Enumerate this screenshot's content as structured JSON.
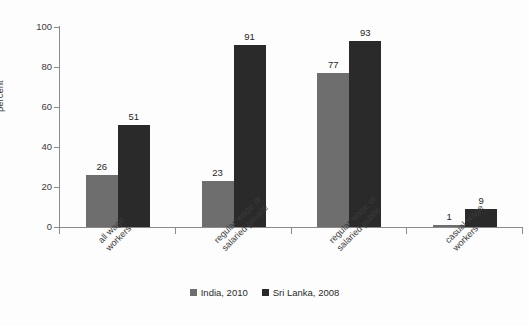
{
  "chart_data": {
    "type": "bar",
    "title": "",
    "subtitle": "",
    "xlabel": "",
    "ylabel": "percent",
    "ylim": [
      0,
      100
    ],
    "yticks": [
      0,
      20,
      40,
      60,
      80,
      100
    ],
    "grid": false,
    "legend_position": "bottom-center",
    "categories": [
      "all wage workers",
      "regular wage or salaried private",
      "regular wage or salaried public",
      "casual wage workers"
    ],
    "category_lines": [
      [
        "all wage",
        "workers"
      ],
      [
        "regular wage or",
        "salaried private"
      ],
      [
        "regular wage or",
        "salaried public"
      ],
      [
        "casual wage",
        "workers"
      ]
    ],
    "series": [
      {
        "name": "India, 2010",
        "color": "#6e6e6e",
        "values": [
          26,
          23,
          77,
          1
        ]
      },
      {
        "name": "Sri Lanka, 2008",
        "color": "#2a2a2a",
        "values": [
          51,
          91,
          93,
          9
        ]
      }
    ]
  },
  "colors": {
    "background": "#fdfdfd",
    "axis": "#8a8a8a",
    "text": "#3a3a3a",
    "series_india": "#6e6e6e",
    "series_sri_lanka": "#2a2a2a"
  }
}
